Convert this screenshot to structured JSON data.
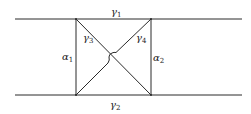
{
  "diagram": {
    "lines": {
      "top": {
        "label_base": "γ",
        "label_sub": "1"
      },
      "bottom": {
        "label_base": "γ",
        "label_sub": "2"
      }
    },
    "verticals": {
      "left": {
        "label_base": "α",
        "label_sub": "1"
      },
      "right": {
        "label_base": "α",
        "label_sub": "2"
      }
    },
    "diagonals": {
      "descending": {
        "label_base": "γ",
        "label_sub": "3"
      },
      "ascending": {
        "label_base": "γ",
        "label_sub": "4"
      }
    },
    "colors": {
      "stroke": "#2a2a2a",
      "background": "#ffffff"
    }
  }
}
